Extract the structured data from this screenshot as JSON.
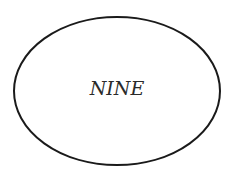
{
  "diagram": {
    "type": "ellipse-node",
    "node": {
      "label": "NINE",
      "shape": "ellipse",
      "stroke_color": "#1a1a1a",
      "fill_color": "#ffffff",
      "text_color": "#2a2a2a"
    }
  }
}
